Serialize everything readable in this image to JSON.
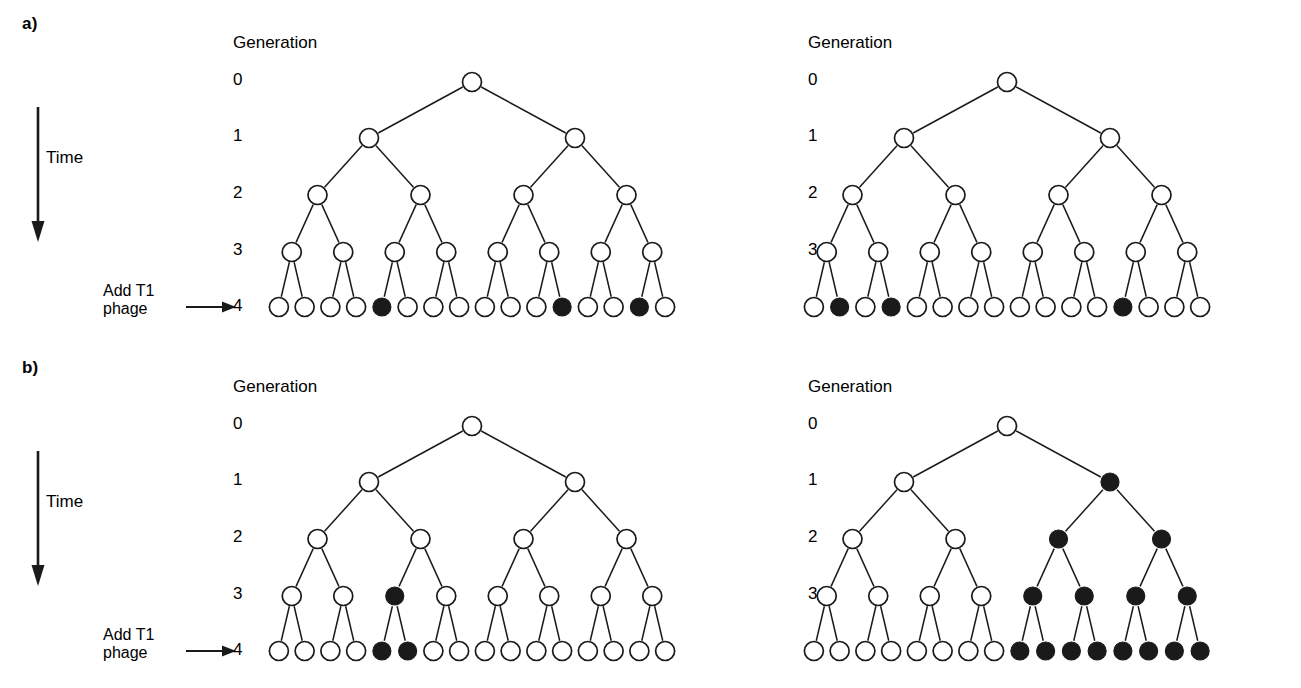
{
  "figure": {
    "background": "#ffffff",
    "stroke_color": "#1a1a1a",
    "node_open_fill": "#ffffff",
    "node_filled_fill": "#1a1a1a"
  },
  "panels": [
    {
      "id": "a",
      "label": "a)",
      "time_label": "Time",
      "add_phage_line1": "Add T1",
      "add_phage_line2": "phage",
      "generation_header": "Generation",
      "generation_numbers": [
        "0",
        "1",
        "2",
        "3",
        "4"
      ],
      "trees": [
        {
          "id": "a-left",
          "name": "random-mutation-culture-1",
          "generations": [
            {
              "gen": 0,
              "count": 1,
              "filled_positions": []
            },
            {
              "gen": 1,
              "count": 2,
              "filled_positions": []
            },
            {
              "gen": 2,
              "count": 4,
              "filled_positions": []
            },
            {
              "gen": 3,
              "count": 8,
              "filled_positions": []
            },
            {
              "gen": 4,
              "count": 16,
              "filled_positions": [
                5,
                12,
                15
              ]
            }
          ],
          "resistant_count": 3
        },
        {
          "id": "a-right",
          "name": "random-mutation-culture-2",
          "generations": [
            {
              "gen": 0,
              "count": 1,
              "filled_positions": []
            },
            {
              "gen": 1,
              "count": 2,
              "filled_positions": []
            },
            {
              "gen": 2,
              "count": 4,
              "filled_positions": []
            },
            {
              "gen": 3,
              "count": 8,
              "filled_positions": []
            },
            {
              "gen": 4,
              "count": 16,
              "filled_positions": [
                2,
                4,
                13
              ]
            }
          ],
          "resistant_count": 3
        }
      ]
    },
    {
      "id": "b",
      "label": "b)",
      "time_label": "Time",
      "add_phage_line1": "Add T1",
      "add_phage_line2": "phage",
      "generation_header": "Generation",
      "generation_numbers": [
        "0",
        "1",
        "2",
        "3",
        "4"
      ],
      "trees": [
        {
          "id": "b-left",
          "name": "early-mutation-culture-1",
          "generations": [
            {
              "gen": 0,
              "count": 1,
              "filled_positions": []
            },
            {
              "gen": 1,
              "count": 2,
              "filled_positions": []
            },
            {
              "gen": 2,
              "count": 4,
              "filled_positions": []
            },
            {
              "gen": 3,
              "count": 8,
              "filled_positions": [
                3
              ]
            },
            {
              "gen": 4,
              "count": 16,
              "filled_positions": [
                5,
                6
              ]
            }
          ],
          "resistant_count": 2
        },
        {
          "id": "b-right",
          "name": "jackpot-mutation-culture-2",
          "generations": [
            {
              "gen": 0,
              "count": 1,
              "filled_positions": []
            },
            {
              "gen": 1,
              "count": 2,
              "filled_positions": [
                2
              ]
            },
            {
              "gen": 2,
              "count": 4,
              "filled_positions": [
                3,
                4
              ]
            },
            {
              "gen": 3,
              "count": 8,
              "filled_positions": [
                5,
                6,
                7,
                8
              ]
            },
            {
              "gen": 4,
              "count": 16,
              "filled_positions": [
                9,
                10,
                11,
                12,
                13,
                14,
                15,
                16
              ]
            }
          ],
          "resistant_count": 8
        }
      ]
    }
  ],
  "geometry": {
    "tree_left_offsets": [
      240,
      775
    ],
    "gen_header_x": [
      233,
      808
    ],
    "gen_num_x": [
      233,
      808
    ],
    "gen_header_y": 33,
    "gen_rows_y": [
      82,
      138,
      195,
      252,
      307
    ],
    "gen_num_y": [
      70,
      126,
      183,
      240,
      296
    ],
    "node_radius_open": 9.5,
    "node_radius_filled": 9.0,
    "tree_span_left": 26,
    "tree_span_right": 438
  }
}
